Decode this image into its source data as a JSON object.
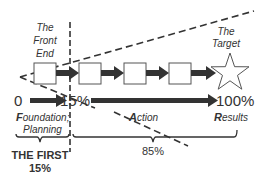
{
  "diagram": {
    "front_end_label": [
      "The",
      "Front",
      "End"
    ],
    "target_label": [
      "The",
      "Target"
    ],
    "scale": {
      "start": "0",
      "mid": "15%",
      "end": "100%"
    },
    "phases": {
      "foundation": {
        "initial": "F",
        "rest": "oundation;",
        "line2": "Planning"
      },
      "action": {
        "initial": "A",
        "rest": "ction"
      },
      "results": {
        "initial": "R",
        "rest": "esults"
      }
    },
    "brackets": {
      "first_label_line1": "THE FIRST",
      "first_label_line2": "15%",
      "rest_label": "85%"
    },
    "process_boxes": 4,
    "colors": {
      "stroke": "#333333",
      "text": "#333333",
      "box_fill": "#ffffff"
    }
  }
}
